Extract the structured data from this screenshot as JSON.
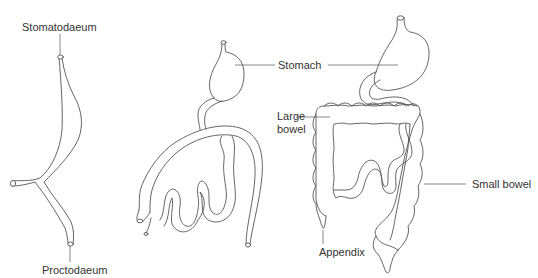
{
  "diagram": {
    "type": "anatomical-line-drawing",
    "stages": [
      {
        "id": "stage-1",
        "labels": [
          "Stomatodaeum",
          "Proctodaeum"
        ]
      },
      {
        "id": "stage-2",
        "labels": []
      },
      {
        "id": "stage-3",
        "labels": [
          "Stomach",
          "Large bowel",
          "Small bowel",
          "Appendix"
        ]
      }
    ]
  },
  "labels": {
    "stomatodaeum": "Stomatodaeum",
    "proctodaeum": "Proctodaeum",
    "stomach": "Stomach",
    "large_bowel_line1": "Large",
    "large_bowel_line2": "bowel",
    "small_bowel": "Small bowel",
    "appendix": "Appendix"
  },
  "colors": {
    "line": "#555555",
    "text": "#333333",
    "background": "#ffffff"
  }
}
